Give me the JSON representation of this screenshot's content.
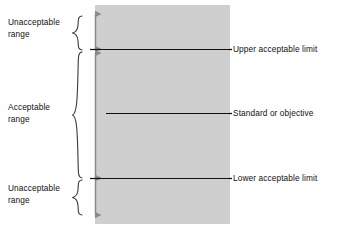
{
  "diagram": {
    "band_color": "#cfcfcf",
    "line_color": "#111111",
    "arrow_color": "#8a8a8a",
    "left_labels": [
      {
        "name": "unacceptable-upper",
        "line1": "Unacceptable",
        "line2": "range"
      },
      {
        "name": "acceptable",
        "line1": "Acceptable",
        "line2": "range"
      },
      {
        "name": "unacceptable-lower",
        "line1": "Unacceptable",
        "line2": "range"
      }
    ],
    "right_labels": [
      {
        "name": "upper-acceptable-limit",
        "text": "Upper  acceptable  limit"
      },
      {
        "name": "standard-or-objective",
        "text": "Standard or objective"
      },
      {
        "name": "lower-acceptable-limit",
        "text": "Lower acceptable limit"
      }
    ]
  }
}
